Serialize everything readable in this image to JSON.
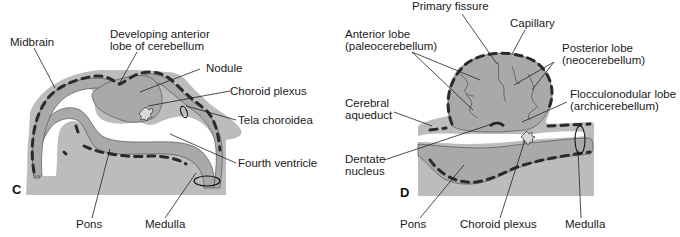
{
  "figure": {
    "type": "embryological cross-section diagram"
  },
  "panels": [
    {
      "id": "C",
      "letter": "C",
      "labels": {
        "midbrain": "Midbrain",
        "anterior_lobe_1": "Developing anterior",
        "anterior_lobe_2": "lobe of cerebellum",
        "nodule": "Nodule",
        "choroid_plexus": "Choroid plexus",
        "tela_choroidea": "Tela choroidea",
        "fourth_ventricle": "Fourth ventricle",
        "pons": "Pons",
        "medulla": "Medulla"
      }
    },
    {
      "id": "D",
      "letter": "D",
      "labels": {
        "primary_fissure": "Primary fissure",
        "capillary": "Capillary",
        "anterior_lobe_1": "Anterior lobe",
        "anterior_lobe_2": "(paleocerebellum)",
        "posterior_lobe_1": "Posterior lobe",
        "posterior_lobe_2": "(neocerebellum)",
        "flocculonodular_1": "Flocculonodular lobe",
        "flocculonodular_2": "(archicerebellum)",
        "cerebral_aqueduct_1": "Cerebral",
        "cerebral_aqueduct_2": "aqueduct",
        "dentate_1": "Dentate",
        "dentate_2": "nucleus",
        "pons": "Pons",
        "choroid_plexus": "Choroid plexus",
        "medulla": "Medulla"
      }
    }
  ],
  "colors": {
    "background": "#ffffff",
    "tissue": "#bcbcbc",
    "neural_tube": "#a9a9a9",
    "capillaries": "#2a2a2a",
    "text": "#1a1a1a"
  }
}
